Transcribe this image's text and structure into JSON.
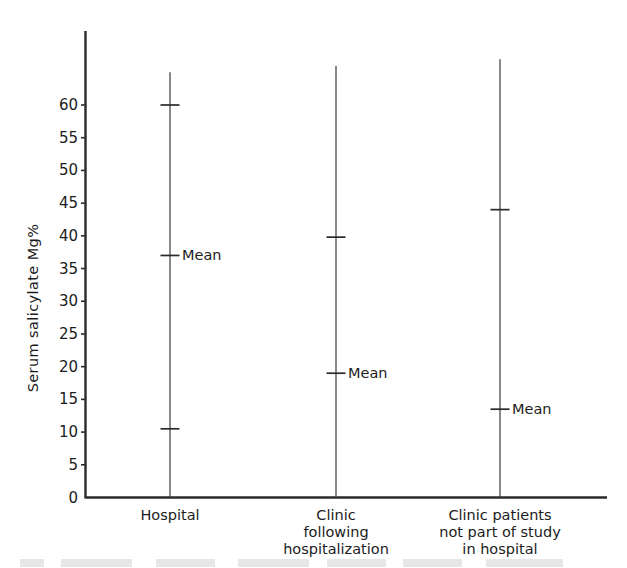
{
  "chart_data": {
    "type": "scatter",
    "title": "",
    "xlabel": "",
    "ylabel": "Serum salicylate  Mg%",
    "ylim": [
      0,
      65
    ],
    "ytick_labels": [
      "0",
      "5",
      "10",
      "15",
      "20",
      "25",
      "30",
      "35",
      "40",
      "45",
      "50",
      "55",
      "60"
    ],
    "ytick_values": [
      0,
      5,
      10,
      15,
      20,
      25,
      30,
      35,
      40,
      45,
      50,
      55,
      60
    ],
    "grid": false,
    "legend": "none",
    "mean_marker_label": "Mean",
    "categories": [
      "Hospital",
      "Clinic following hospitalization",
      "Clinic patients not part of study in hospital"
    ],
    "groups": [
      {
        "name": "Hospital",
        "label_lines": [
          "Hospital"
        ],
        "range_min": 0,
        "range_max": 65,
        "upper_cap": 60,
        "lower_cap": 10.5,
        "mean": 37,
        "mean_label": "Mean"
      },
      {
        "name": "Clinic following hospitalization",
        "label_lines": [
          "Clinic",
          "following",
          "hospitalization"
        ],
        "range_min": 0,
        "range_max": 66,
        "upper_cap": 39.8,
        "lower_cap": null,
        "mean": 19,
        "mean_label": "Mean"
      },
      {
        "name": "Clinic patients not part of study in hospital",
        "label_lines": [
          "Clinic patients",
          "not part of study",
          "in hospital"
        ],
        "range_min": 0,
        "range_max": 67,
        "upper_cap": 44,
        "lower_cap": null,
        "mean": 13.5,
        "mean_label": "Mean"
      }
    ]
  },
  "axis": {
    "y_axis_name": "y-axis",
    "x_axis_name": "x-axis"
  }
}
